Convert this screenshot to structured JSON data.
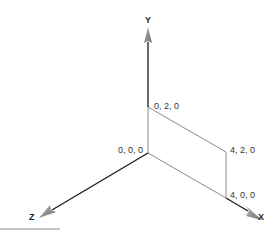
{
  "diagram": {
    "type": "3d-coordinate-axes",
    "axes": {
      "x": {
        "label": "X"
      },
      "y": {
        "label": "Y"
      },
      "z": {
        "label": "Z"
      }
    },
    "points": [
      {
        "label": "0, 0, 0"
      },
      {
        "label": "0, 2, 0"
      },
      {
        "label": "4, 2, 0"
      },
      {
        "label": "4, 0, 0"
      }
    ],
    "colors": {
      "axis": "#1a1a1a",
      "arrowhead": "#8a8a8a",
      "rectangle": "#8c8c8c"
    }
  }
}
